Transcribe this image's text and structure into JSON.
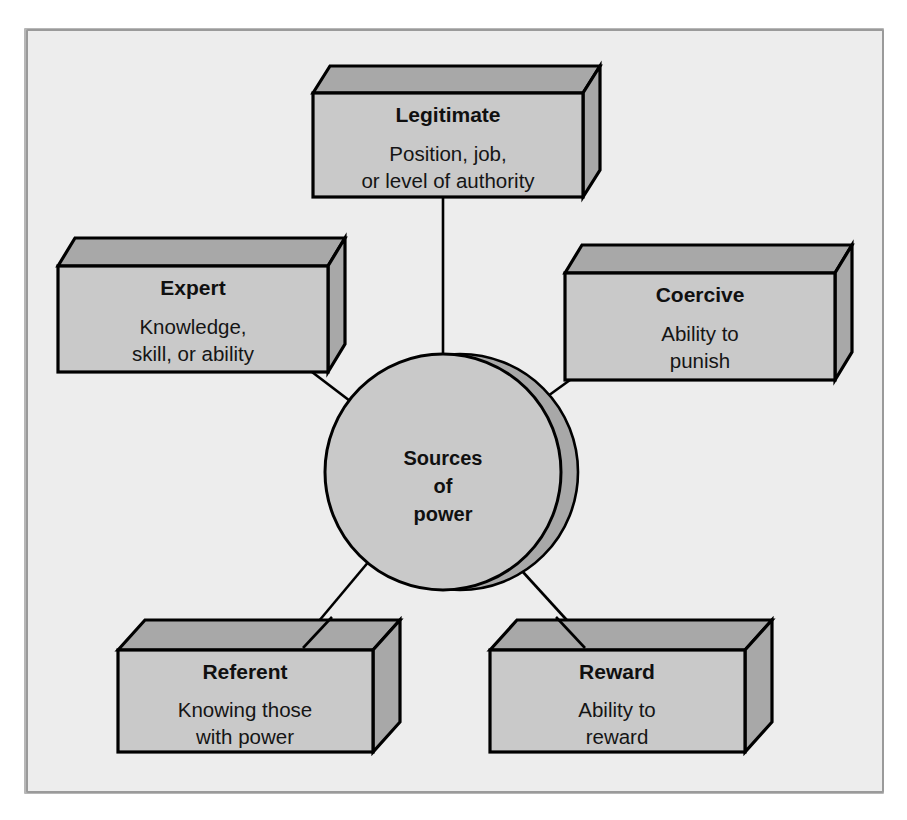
{
  "diagram": {
    "title": "Sources of power",
    "hub": {
      "label_line1": "Sources",
      "label_line2": "of",
      "label_line3": "power"
    },
    "colors": {
      "page_background": "#ffffff",
      "frame_background": "#ededed",
      "frame_border": "#9a9a9a",
      "box_front_face": "#c9c9c9",
      "box_top_face": "#a8a8a8",
      "box_side_face": "#a8a8a8",
      "outline": "#000000",
      "text": "#101010"
    },
    "nodes": [
      {
        "id": "legitimate",
        "title": "Legitimate",
        "desc_line1": "Position, job,",
        "desc_line2": "or level of authority",
        "position": "top"
      },
      {
        "id": "expert",
        "title": "Expert",
        "desc_line1": "Knowledge,",
        "desc_line2": "skill, or ability",
        "position": "upper-left"
      },
      {
        "id": "coercive",
        "title": "Coercive",
        "desc_line1": "Ability to",
        "desc_line2": "punish",
        "position": "upper-right"
      },
      {
        "id": "referent",
        "title": "Referent",
        "desc_line1": "Knowing those",
        "desc_line2": "with power",
        "position": "lower-left"
      },
      {
        "id": "reward",
        "title": "Reward",
        "desc_line1": "Ability to",
        "desc_line2": "reward",
        "position": "lower-right"
      }
    ],
    "connections": [
      {
        "from": "hub",
        "to": "legitimate"
      },
      {
        "from": "hub",
        "to": "expert"
      },
      {
        "from": "hub",
        "to": "coercive"
      },
      {
        "from": "hub",
        "to": "referent"
      },
      {
        "from": "hub",
        "to": "reward"
      }
    ]
  }
}
